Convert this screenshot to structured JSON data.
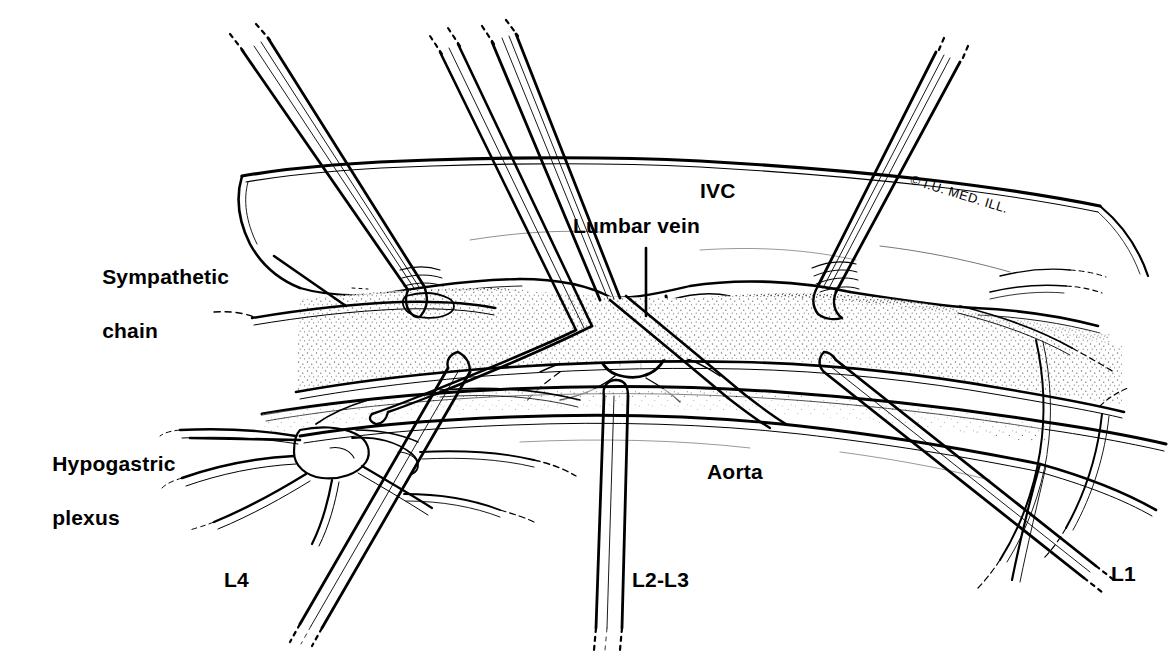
{
  "figure": {
    "style": "pen-and-ink medical line illustration",
    "background_color": "#ffffff",
    "ink_color": "#000000",
    "width": 1174,
    "height": 662
  },
  "labels": {
    "ivc": "IVC",
    "lumbar_vein": "Lumbar vein",
    "sympathetic_chain_line1": "Sympathetic",
    "sympathetic_chain_line2": "chain",
    "hypogastric_plexus_line1": "Hypogastric",
    "hypogastric_plexus_line2": "plexus",
    "aorta": "Aorta",
    "l4": "L4",
    "l2_l3": "L2-L3",
    "l1": "L1"
  },
  "credit": {
    "text": "I.U. MED. ILL.",
    "symbol": "©",
    "full": "© I.U. MED. ILL."
  },
  "anatomy": {
    "structures": [
      "inferior vena cava",
      "aorta",
      "lumbar vein",
      "sympathetic chain",
      "hypogastric plexus",
      "retroperitoneal fatty tissue"
    ],
    "instrument_count": 6,
    "instrument_names": [
      "retractor-upper-left",
      "retractor-upper-center-a",
      "retractor-upper-center-b",
      "retractor-upper-right",
      "retractor-lower-left-L4",
      "retractor-lower-center-L2L3",
      "retractor-lower-right-L1"
    ]
  }
}
